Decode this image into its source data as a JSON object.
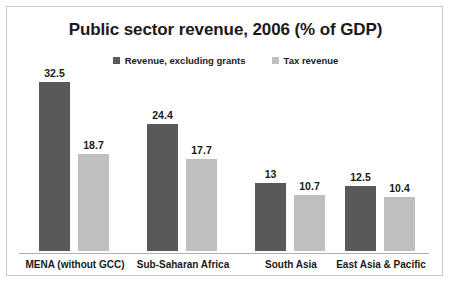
{
  "chart_data": {
    "type": "bar",
    "title": "Public sector revenue, 2006 (% of GDP)",
    "xlabel": "",
    "ylabel": "",
    "ylim": [
      0,
      35
    ],
    "grid": false,
    "legend_position": "top-center",
    "categories": [
      "MENA (without GCC)",
      "Sub-Saharan Africa",
      "South Asia",
      "East Asia & Pacific"
    ],
    "series": [
      {
        "name": "Revenue, excluding grants",
        "color": "#595959",
        "values": [
          32.5,
          24.4,
          13,
          12.5
        ],
        "labels": [
          "32.5",
          "24.4",
          "13",
          "12.5"
        ]
      },
      {
        "name": "Tax revenue",
        "color": "#bfbfbf",
        "values": [
          18.7,
          17.7,
          10.7,
          10.4
        ],
        "labels": [
          "18.7",
          "17.7",
          "10.7",
          "10.4"
        ]
      }
    ]
  },
  "colors": {
    "series_dark": "#595959",
    "series_light": "#bfbfbf",
    "border": "#c9c9c9",
    "axis": "#b0b0b0",
    "text": "#1a1a1a",
    "background": "#ffffff"
  }
}
